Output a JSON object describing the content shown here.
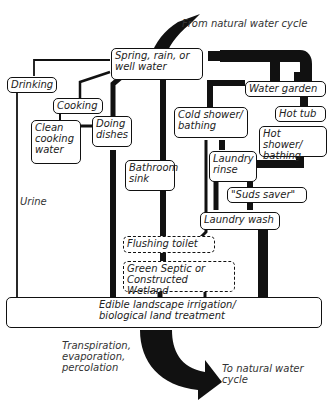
{
  "diagram": {
    "labels": {
      "from_cycle": "From natural water cycle",
      "to_cycle": "To natural water\ncycle",
      "transpiration": "Transpiration,\nevaporation,\npercolation",
      "urine": "Urine"
    },
    "nodes": {
      "source": "Spring, rain, or\nwell water",
      "drinking": "Drinking",
      "cooking": "Cooking",
      "clean_cooking_water": "Clean\ncooking\nwater",
      "doing_dishes": "Doing\ndishes",
      "water_garden": "Water garden",
      "hot_tub": "Hot tub",
      "cold_shower": "Cold shower/\nbathing",
      "hot_shower": "Hot shower/\nbathing",
      "bathroom_sink": "Bathroom\nsink",
      "laundry_rinse": "Laundry\nrinse",
      "suds_saver": "\"Suds saver\"",
      "laundry_wash": "Laundry wash",
      "flushing_toilet": "Flushing toilet",
      "green_septic": "Green Septic or\nConstructed Wetland",
      "land_treatment": "Edible landscape irrigation/\nbiological land treatment"
    },
    "colors": {
      "line": "#111111",
      "background": "#ffffff",
      "text": "#222222"
    }
  }
}
